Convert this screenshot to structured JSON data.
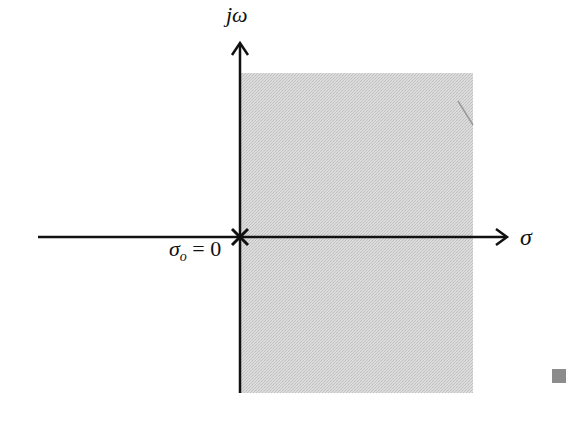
{
  "diagram": {
    "axes": {
      "vertical_label": "jω",
      "horizontal_label": "σ"
    },
    "origin_marker": {
      "symbol": "×",
      "label_sigma": "σ",
      "label_sub": "o",
      "label_eq": " = 0"
    },
    "region": {
      "description": "shaded half-plane Re(s) > σo",
      "fill_color": "#d4d4d4"
    },
    "colors": {
      "axis": "#111111",
      "shade": "#d4d4d4",
      "corner_square": "#8c8c8c"
    }
  }
}
